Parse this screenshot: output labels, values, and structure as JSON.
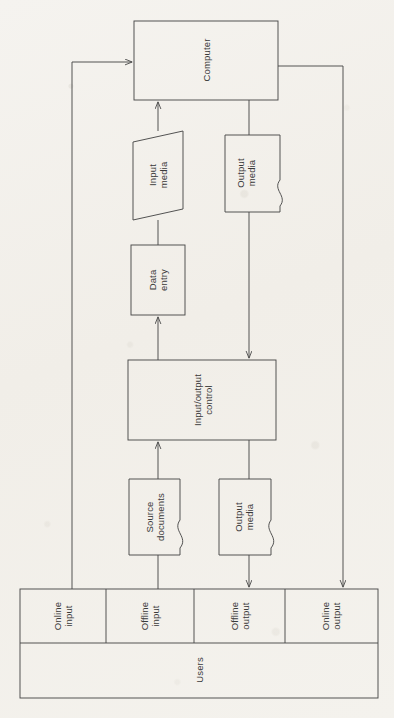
{
  "diagram": {
    "orientation": "rotated-90-ccw",
    "line_color": "#4a4a4a",
    "paper_color": "#f3f1ec",
    "text_color": "#3a3a3a",
    "nodes": {
      "computer": {
        "label": "Computer",
        "shape": "rectangle"
      },
      "input_media": {
        "label": "Input\nmedia",
        "shape": "parallelogram"
      },
      "output_media_top": {
        "label": "Output\nmedia",
        "shape": "document"
      },
      "data_entry": {
        "label": "Data\nentry",
        "shape": "rectangle"
      },
      "io_control": {
        "label": "Input/output\ncontrol",
        "shape": "rectangle"
      },
      "source_documents": {
        "label": "Source\ndocuments",
        "shape": "document"
      },
      "output_media_bottom": {
        "label": "Output\nmedia",
        "shape": "document"
      },
      "users": {
        "label": "Users",
        "shape": "rectangle"
      }
    },
    "user_channels": [
      {
        "label": "Online\ninput"
      },
      {
        "label": "Offline\ninput"
      },
      {
        "label": "Offline\noutput"
      },
      {
        "label": "Online\noutput"
      }
    ]
  }
}
